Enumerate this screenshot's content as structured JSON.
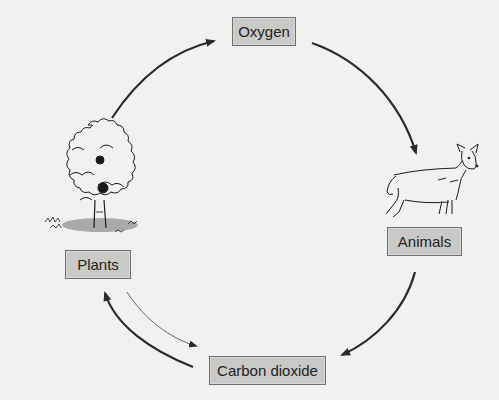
{
  "diagram": {
    "type": "cycle",
    "nodes": [
      {
        "id": "oxygen",
        "label": "Oxygen"
      },
      {
        "id": "animals",
        "label": "Animals"
      },
      {
        "id": "carbon_dioxide",
        "label": "Carbon dioxide"
      },
      {
        "id": "plants",
        "label": "Plants"
      }
    ],
    "edges": [
      {
        "from": "plants",
        "to": "oxygen",
        "style": "thick"
      },
      {
        "from": "oxygen",
        "to": "animals",
        "style": "thick"
      },
      {
        "from": "animals",
        "to": "carbon_dioxide",
        "style": "thick"
      },
      {
        "from": "carbon_dioxide",
        "to": "plants",
        "style": "thick"
      },
      {
        "from": "plants",
        "to": "carbon_dioxide",
        "style": "thin"
      }
    ],
    "illustrations": [
      {
        "node": "plants",
        "icon": "tree-icon"
      },
      {
        "node": "animals",
        "icon": "deer-icon"
      }
    ]
  },
  "colors": {
    "background": "#f1f1ef",
    "box_fill": "#c9c9c7",
    "box_border": "#6f6f6d",
    "arrow": "#2a2a2a",
    "text": "#222222"
  }
}
